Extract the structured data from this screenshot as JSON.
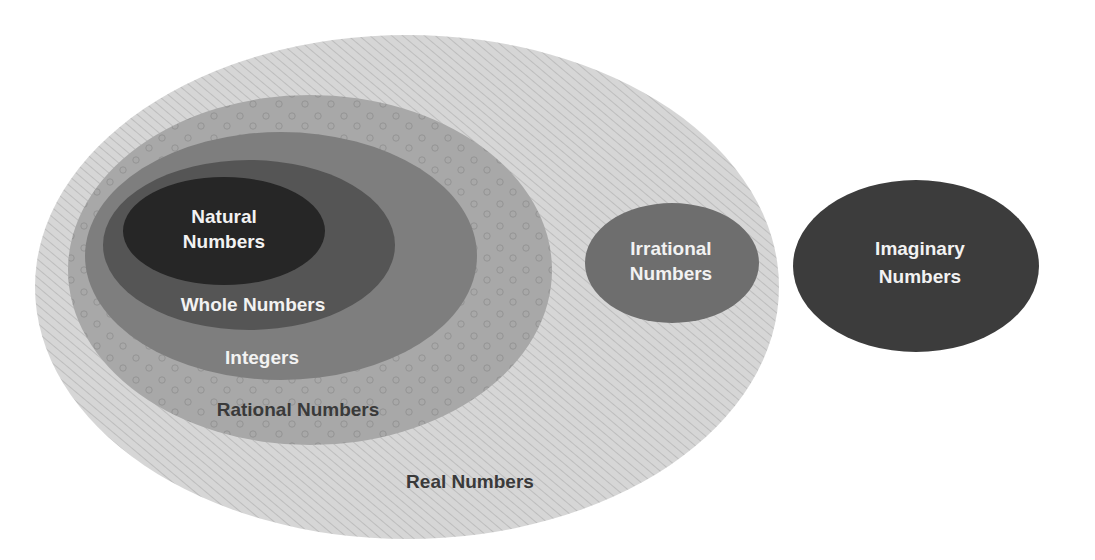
{
  "diagram": {
    "sets": [
      {
        "id": "real",
        "label": "Real Numbers",
        "lines": [
          "Real Numbers"
        ],
        "fill": "#d4d4d4",
        "text_color": "#3a3a3a",
        "pattern": "hatch"
      },
      {
        "id": "rational",
        "label": "Rational Numbers",
        "lines": [
          "Rational Numbers"
        ],
        "fill": "#a6a6a6",
        "text_color": "#3a3a3a",
        "pattern": "dots"
      },
      {
        "id": "integers",
        "label": "Integers",
        "lines": [
          "Integers"
        ],
        "fill": "#7e7e7e",
        "text_color": "#f2f2f2"
      },
      {
        "id": "whole",
        "label": "Whole Numbers",
        "lines": [
          "Whole Numbers"
        ],
        "fill": "#555555",
        "text_color": "#f2f2f2"
      },
      {
        "id": "natural",
        "label": "Natural Numbers",
        "lines": [
          "Natural",
          "Numbers"
        ],
        "fill": "#262626",
        "text_color": "#f2f2f2"
      },
      {
        "id": "irrational",
        "label": "Irrational Numbers",
        "lines": [
          "Irrational",
          "Numbers"
        ],
        "fill": "#6e6e6e",
        "text_color": "#f2f2f2"
      },
      {
        "id": "imaginary",
        "label": "Imaginary Numbers",
        "lines": [
          "Imaginary",
          "Numbers"
        ],
        "fill": "#3c3c3c",
        "text_color": "#f2f2f2"
      }
    ],
    "relationships": [
      "Natural Numbers ⊂ Whole Numbers",
      "Whole Numbers ⊂ Integers",
      "Integers ⊂ Rational Numbers",
      "Rational Numbers ⊂ Real Numbers",
      "Irrational Numbers ⊂ Real Numbers",
      "Imaginary Numbers outside Real Numbers"
    ]
  }
}
